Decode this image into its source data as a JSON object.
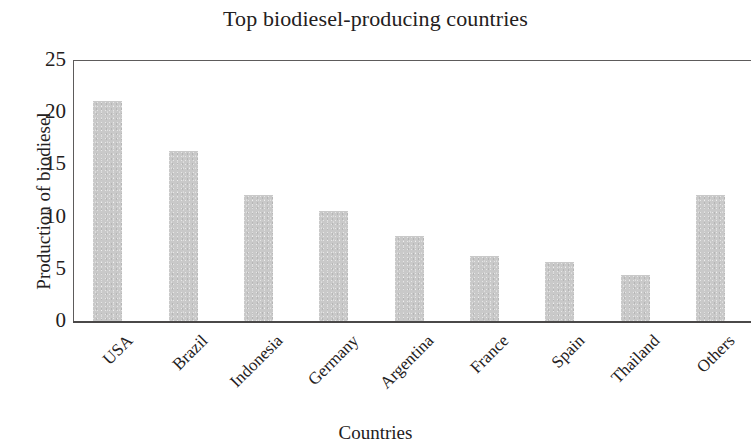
{
  "chart_data": {
    "type": "bar",
    "title": "Top biodiesel-producing countries",
    "xlabel": "Countries",
    "ylabel": "Production of biodiesel",
    "categories": [
      "USA",
      "Brazil",
      "Indonesia",
      "Germany",
      "Argentina",
      "France",
      "Spain",
      "Thailand",
      "Others"
    ],
    "values": [
      21.3,
      16.5,
      12.3,
      10.7,
      8.3,
      6.4,
      5.8,
      4.6,
      12.3
    ],
    "ylim": [
      0,
      25
    ],
    "yticks": [
      0,
      5,
      10,
      15,
      20,
      25
    ],
    "ytick_labels": [
      "0",
      "5",
      "10",
      "15",
      "20",
      "25"
    ],
    "grid": false,
    "legend": null,
    "bar_color": "#c9c9c9",
    "axis_color": "#4a4848",
    "text_color": "#232020",
    "xtick_rotation": -45
  }
}
